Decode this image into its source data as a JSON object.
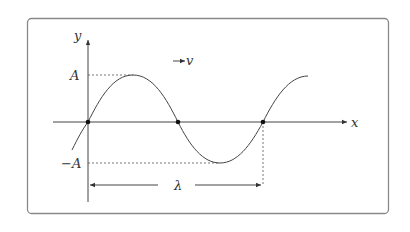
{
  "diagram": {
    "title": "",
    "labels": {
      "y_axis": "y",
      "x_axis": "x",
      "amplitude_pos": "A",
      "amplitude_neg": "−A",
      "wavelength": "λ",
      "velocity": "v"
    },
    "colors": {
      "frame": "#8a8a8a",
      "stroke": "#333333",
      "dashed": "#555555"
    },
    "points": [
      {
        "name": "origin-node",
        "x": 88,
        "y": 122
      },
      {
        "name": "mid-node",
        "x": 178,
        "y": 122
      },
      {
        "name": "end-node",
        "x": 263,
        "y": 122
      }
    ]
  }
}
